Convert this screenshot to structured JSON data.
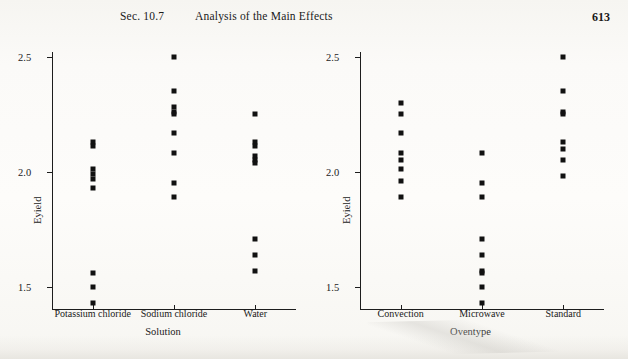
{
  "runhead": {
    "section": "Sec. 10.7",
    "title": "Analysis of the Main Effects",
    "page_number": "613"
  },
  "chart_data": [
    {
      "id": "left",
      "type": "scatter",
      "title": "",
      "xlabel": "Solution",
      "ylabel": "Eyield",
      "categories": [
        "Potassium chloride",
        "Sodium chloride",
        "Water"
      ],
      "ylim": [
        1.4,
        2.52
      ],
      "yticks": [
        1.5,
        2.0,
        2.5
      ],
      "ytick_labels": [
        "1.5",
        "2.0",
        "2.5"
      ],
      "grid": false,
      "legend": "none",
      "series": [
        {
          "name": "Potassium chloride",
          "values": [
            2.13,
            2.11,
            2.01,
            1.99,
            1.97,
            1.93,
            1.56,
            1.5,
            1.43
          ]
        },
        {
          "name": "Sodium chloride",
          "values": [
            2.5,
            2.35,
            2.28,
            2.26,
            2.25,
            2.17,
            2.08,
            1.95,
            1.89
          ]
        },
        {
          "name": "Water",
          "values": [
            2.25,
            2.13,
            2.11,
            2.07,
            2.05,
            2.04,
            1.71,
            1.64,
            1.57
          ]
        }
      ]
    },
    {
      "id": "right",
      "type": "scatter",
      "title": "",
      "xlabel": "Oventype",
      "ylabel": "Eyield",
      "categories": [
        "Convection",
        "Microwave",
        "Standard"
      ],
      "ylim": [
        1.4,
        2.52
      ],
      "yticks": [
        1.5,
        2.0,
        2.5
      ],
      "ytick_labels": [
        "1.5",
        "2.0",
        "2.5"
      ],
      "grid": false,
      "legend": "none",
      "series": [
        {
          "name": "Convection",
          "values": [
            2.3,
            2.25,
            2.17,
            2.08,
            2.05,
            2.01,
            1.96,
            1.89
          ]
        },
        {
          "name": "Microwave",
          "values": [
            2.08,
            1.95,
            1.89,
            1.71,
            1.64,
            1.57,
            1.56,
            1.5,
            1.43
          ]
        },
        {
          "name": "Standard",
          "values": [
            2.5,
            2.35,
            2.26,
            2.25,
            2.13,
            2.1,
            2.05,
            1.98
          ]
        }
      ]
    }
  ]
}
